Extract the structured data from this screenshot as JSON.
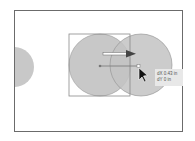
{
  "canvas": {
    "frame_color": "#6b6b6b",
    "shape_fill": "#c8c8c8",
    "shape_stroke": "#9a9a9a"
  },
  "shapes": [
    {
      "name": "partial-circle-left",
      "cx": 14,
      "cy": 67,
      "r": 20
    },
    {
      "name": "original-circle",
      "cx": 100,
      "cy": 65,
      "r": 31
    },
    {
      "name": "dragged-circle",
      "cx": 141,
      "cy": 65,
      "r": 31
    }
  ],
  "selection_box": {
    "x": 69,
    "y": 34,
    "w": 61,
    "h": 62
  },
  "tooltip": {
    "dx": "dX 0.43 in",
    "dy": "dY 0 in"
  }
}
